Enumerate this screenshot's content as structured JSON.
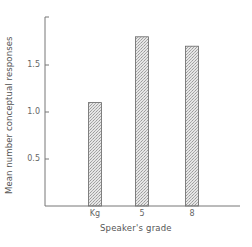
{
  "chart_data": {
    "type": "bar",
    "title": "",
    "xlabel": "Speaker's grade",
    "ylabel": "Mean number conceptual responses",
    "categories": [
      "Kg",
      "5",
      "8"
    ],
    "values": [
      1.1,
      1.8,
      1.7
    ],
    "ylim": [
      0,
      2.0
    ],
    "yticks": [
      "0.5",
      "1.0",
      "1.5"
    ],
    "ytick_values": [
      0.5,
      1.0,
      1.5
    ],
    "grid": false,
    "legend": null,
    "bar_fill": "hatched gray"
  },
  "colors": {
    "axis": "#777777",
    "bar_edge": "#666666",
    "bar_fill": "#d8d8d8"
  }
}
